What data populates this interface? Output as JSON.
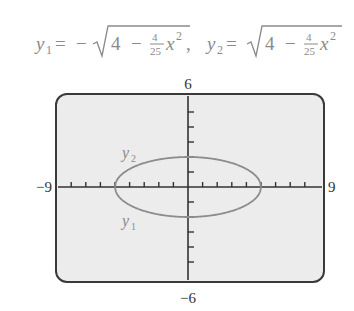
{
  "formula": {
    "y1_label": "y",
    "y1_sub": "1",
    "y2_label": "y",
    "y2_sub": "2",
    "eq": "=",
    "minus": "−",
    "radicand_const": "4",
    "radicand_op": "−",
    "frac_num": "4",
    "frac_den": "25",
    "var": "x",
    "exp": "2",
    "separator": ","
  },
  "axis_labels": {
    "ymax": "6",
    "ymin": "−6",
    "xmin": "−9",
    "xmax": "9"
  },
  "curve_labels": {
    "upper": "y",
    "upper_sub": "2",
    "lower": "y",
    "lower_sub": "1"
  },
  "colors": {
    "background": "#ffffff",
    "screen_fill": "#ececec",
    "frame": "#3a3a3a",
    "axis": "#333333",
    "curve": "#8c8c8c",
    "text": "#8a8a8a",
    "tick_label": "#333333"
  },
  "chart_data": {
    "type": "line",
    "xlabel": "",
    "ylabel": "",
    "xlim": [
      -9,
      9
    ],
    "ylim": [
      -6,
      6
    ],
    "xscale_ticks": 1,
    "yscale_ticks": 1,
    "grid": false,
    "legend": "inline labels y2 (upper branch), y1 (lower branch)",
    "series": [
      {
        "name": "y2",
        "equation": "sqrt(4 - (4/25)x^2)",
        "x": [
          -5,
          -4,
          -3,
          -2,
          -1,
          0,
          1,
          2,
          3,
          4,
          5
        ],
        "values": [
          0,
          1.2,
          1.6,
          1.83,
          1.96,
          2,
          1.96,
          1.83,
          1.6,
          1.2,
          0
        ]
      },
      {
        "name": "y1",
        "equation": "-sqrt(4 - (4/25)x^2)",
        "x": [
          -5,
          -4,
          -3,
          -2,
          -1,
          0,
          1,
          2,
          3,
          4,
          5
        ],
        "values": [
          0,
          -1.2,
          -1.6,
          -1.83,
          -1.96,
          -2,
          -1.96,
          -1.83,
          -1.6,
          -1.2,
          0
        ]
      }
    ]
  }
}
